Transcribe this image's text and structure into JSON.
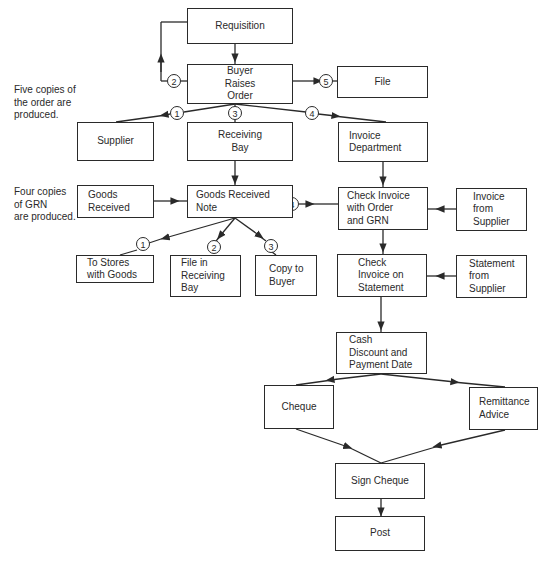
{
  "diagram": {
    "type": "flowchart",
    "notes": {
      "order_copies": "Five copies of\nthe order are\nproduced.",
      "grn_copies": "Four copies\nof GRN\nare produced."
    },
    "nodes": {
      "requisition": "Requisition",
      "buyer_raises_order": "Buyer\nRaises\nOrder",
      "file": "File",
      "supplier": "Supplier",
      "receiving_bay": "Receiving\nBay",
      "invoice_department": "Invoice\nDepartment",
      "goods_received": "Goods\nReceived",
      "goods_received_note": "Goods Received\nNote",
      "check_invoice_order_grn": "Check Invoice\nwith Order\nand GRN",
      "invoice_from_supplier": "Invoice\nfrom\nSupplier",
      "to_stores_with_goods": "To Stores\nwith Goods",
      "file_in_receiving_bay": "File in\nReceiving\nBay",
      "copy_to_buyer": "Copy to\nBuyer",
      "check_invoice_statement": "Check\nInvoice on\nStatement",
      "statement_from_supplier": "Statement\nfrom\nSupplier",
      "cash_discount_payment_date": "Cash\nDiscount and\nPayment Date",
      "cheque": "Cheque",
      "remittance_advice": "Remittance\nAdvice",
      "sign_cheque": "Sign Cheque",
      "post": "Post"
    },
    "order_copy_labels": {
      "c1": "1",
      "c2": "2",
      "c3": "3",
      "c4": "4",
      "c5": "5"
    },
    "grn_copy_labels": {
      "c1": "1",
      "c2": "2",
      "c3": "3",
      "c4": "4"
    },
    "edges": [
      {
        "from": "Requisition",
        "to": "Buyer Raises Order"
      },
      {
        "from": "Buyer Raises Order",
        "to": "Requisition",
        "label": "2"
      },
      {
        "from": "Buyer Raises Order",
        "to": "File",
        "label": "5"
      },
      {
        "from": "Buyer Raises Order",
        "to": "Supplier",
        "label": "1"
      },
      {
        "from": "Buyer Raises Order",
        "to": "Receiving Bay",
        "label": "3"
      },
      {
        "from": "Buyer Raises Order",
        "to": "Invoice Department",
        "label": "4"
      },
      {
        "from": "Receiving Bay",
        "to": "Goods Received Note"
      },
      {
        "from": "Goods Received",
        "to": "Goods Received Note"
      },
      {
        "from": "Invoice Department",
        "to": "Check Invoice with Order and GRN"
      },
      {
        "from": "Goods Received Note",
        "to": "Check Invoice with Order and GRN",
        "label": "4"
      },
      {
        "from": "Invoice from Supplier",
        "to": "Check Invoice with Order and GRN"
      },
      {
        "from": "Goods Received Note",
        "to": "To Stores with Goods",
        "label": "1"
      },
      {
        "from": "Goods Received Note",
        "to": "File in Receiving Bay",
        "label": "2"
      },
      {
        "from": "Goods Received Note",
        "to": "Copy to Buyer",
        "label": "3"
      },
      {
        "from": "Check Invoice with Order and GRN",
        "to": "Check Invoice on Statement"
      },
      {
        "from": "Statement from Supplier",
        "to": "Check Invoice on Statement"
      },
      {
        "from": "Check Invoice on Statement",
        "to": "Cash Discount and Payment Date"
      },
      {
        "from": "Cash Discount and Payment Date",
        "to": "Cheque"
      },
      {
        "from": "Cash Discount and Payment Date",
        "to": "Remittance Advice"
      },
      {
        "from": "Cheque",
        "to": "Sign Cheque"
      },
      {
        "from": "Remittance Advice",
        "to": "Sign Cheque"
      },
      {
        "from": "Sign Cheque",
        "to": "Post"
      }
    ],
    "colors": {
      "line": "#2a2a2a",
      "background": "#ffffff"
    }
  }
}
